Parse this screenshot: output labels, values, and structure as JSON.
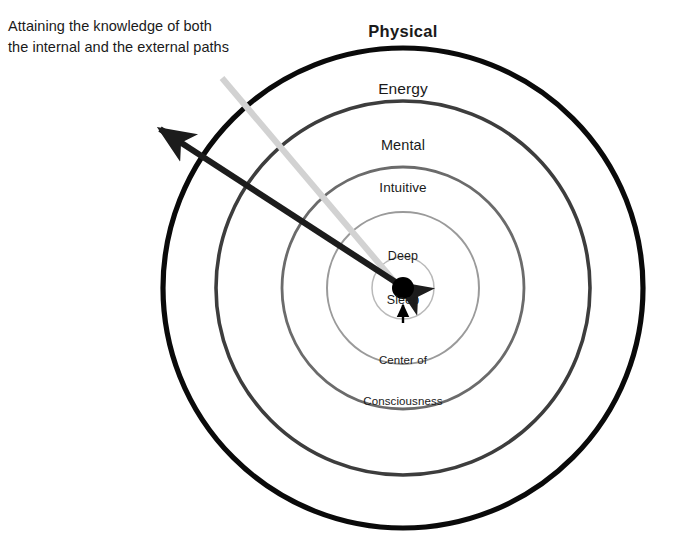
{
  "diagram": {
    "title_caption": "Attaining the knowledge of both\nthe internal and the external paths",
    "center_x": 403,
    "center_y": 288,
    "rings": [
      {
        "id": "physical",
        "label": "Physical",
        "radius": 240,
        "stroke": "#0a0a0a",
        "stroke_width": 5.2,
        "bold": true
      },
      {
        "id": "energy",
        "label": "Energy",
        "radius": 187,
        "stroke": "#3d3d3d",
        "stroke_width": 3.6,
        "bold": false
      },
      {
        "id": "mental",
        "label": "Mental",
        "radius": 121,
        "stroke": "#6b6b6b",
        "stroke_width": 2.8,
        "bold": false
      },
      {
        "id": "intuitive",
        "label": "Intuitive",
        "radius": 76,
        "stroke": "#9a9a9a",
        "stroke_width": 2.0,
        "bold": false
      },
      {
        "id": "deep-sleep",
        "label": "Deep\nSleep",
        "radius": 31,
        "stroke": "#b9b9b9",
        "stroke_width": 1.5,
        "bold": false
      }
    ],
    "center_node": {
      "label": "Center of\nConsciousness",
      "radius": 11,
      "fill": "#000000"
    },
    "pointer_arrow": {
      "name": "center-pointer-arrow",
      "from_x": 403,
      "from_y": 323,
      "to_x": 403,
      "to_y": 303,
      "color": "#000000"
    },
    "internal_path_arrow": {
      "name": "internal-path-arrow",
      "from_x": 403,
      "from_y": 288,
      "to_x": 152,
      "to_y": 122,
      "color": "#1c1c1c",
      "stroke_width": 6,
      "double_headed": true
    },
    "external_path_line": {
      "name": "external-path-leader-line",
      "from_x": 222,
      "from_y": 78,
      "to_x": 399,
      "to_y": 287,
      "color": "#d2d2d2",
      "stroke_width": 6
    },
    "labels": {
      "physical": "Physical",
      "energy": "Energy",
      "mental": "Mental",
      "intuitive": "Intuitive",
      "deep_sleep_line1": "Deep",
      "deep_sleep_line2": "Sleep",
      "center_line1": "Center of",
      "center_line2": "Consciousness"
    },
    "caption_line1": "Attaining the knowledge of both",
    "caption_line2": "the internal and the external paths"
  }
}
